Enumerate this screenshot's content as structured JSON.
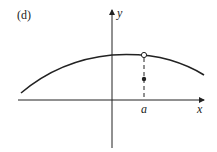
{
  "figure": {
    "panel_label": "(d)",
    "axes": {
      "x_label": "x",
      "y_label": "y"
    },
    "tick_labels": {
      "a": "a"
    },
    "curve": {
      "shape": "concave-down arc",
      "color": "#222222"
    },
    "open_point": {
      "at": "x = a on curve",
      "fill": "#ffffff"
    },
    "filled_point": {
      "at": "x = a below curve",
      "fill": "#222222"
    },
    "dashed_line": {
      "from": "curve at x = a",
      "to": "x-axis"
    }
  }
}
